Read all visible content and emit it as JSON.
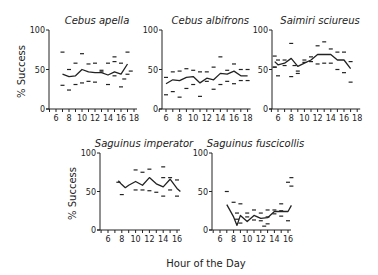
{
  "figure": {
    "x_label": "Hour of the Day",
    "y_label": "% Success",
    "colors": {
      "ink": "#222222",
      "background": "#ffffff"
    }
  },
  "chart_data": [
    {
      "type": "line",
      "title": "Cebus apella",
      "xlabel": "Hour of the Day",
      "ylabel": "% Success",
      "xlim": [
        5,
        18
      ],
      "ylim": [
        0,
        100
      ],
      "x_ticks": [
        6,
        8,
        10,
        12,
        14,
        16,
        18
      ],
      "y_ticks": [
        0,
        50,
        100
      ],
      "show_ylabel": true,
      "layout": {
        "ox": 49,
        "oy": 109,
        "ytop": 30,
        "x6": 56,
        "pxPerHour": 6.5
      },
      "x": [
        7,
        8,
        9,
        10,
        11,
        12,
        13,
        14,
        15,
        16,
        17
      ],
      "series": [
        {
          "name": "mean",
          "values": [
            44,
            41,
            42,
            50,
            47,
            46,
            46,
            43,
            47,
            44,
            57
          ]
        },
        {
          "name": "upper",
          "values": [
            72,
            50,
            58,
            70,
            57,
            58,
            49,
            58,
            60,
            58,
            72
          ]
        },
        {
          "name": "lower",
          "values": [
            30,
            24,
            31,
            33,
            35,
            34,
            47,
            31,
            42,
            28,
            44
          ]
        }
      ],
      "extra_marks": [
        {
          "x": 17.5,
          "y": 48
        },
        {
          "x": 16.5,
          "y": 38
        },
        {
          "x": 15,
          "y": 66
        }
      ]
    },
    {
      "type": "line",
      "title": "Cebus albifrons",
      "xlabel": "Hour of the Day",
      "ylabel": "",
      "xlim": [
        5,
        18
      ],
      "ylim": [
        0,
        100
      ],
      "x_ticks": [
        6,
        8,
        10,
        12,
        14,
        16,
        18
      ],
      "y_ticks": [
        0,
        50,
        100
      ],
      "show_ylabel": false,
      "layout": {
        "ox": 162,
        "oy": 109,
        "ytop": 30,
        "x6": 166,
        "pxPerHour": 6.8
      },
      "x": [
        6,
        7,
        8,
        9,
        10,
        11,
        12,
        13,
        14,
        15,
        16,
        17,
        18
      ],
      "series": [
        {
          "name": "mean",
          "values": [
            32,
            37,
            36,
            40,
            41,
            33,
            39,
            37,
            45,
            44,
            48,
            42,
            42
          ]
        },
        {
          "name": "upper",
          "values": [
            40,
            47,
            48,
            51,
            49,
            47,
            47,
            53,
            66,
            49,
            57,
            50,
            50
          ]
        },
        {
          "name": "lower",
          "values": [
            18,
            22,
            15,
            26,
            31,
            16,
            35,
            25,
            31,
            35,
            32,
            36,
            36
          ]
        }
      ],
      "extra_marks": []
    },
    {
      "type": "line",
      "title": "Saimiri sciureus",
      "xlabel": "Hour of the Day",
      "ylabel": "",
      "xlim": [
        5,
        18
      ],
      "ylim": [
        0,
        100
      ],
      "x_ticks": [
        6,
        8,
        10,
        12,
        14,
        16,
        18
      ],
      "y_ticks": [
        0,
        50,
        100
      ],
      "show_ylabel": false,
      "layout": {
        "ox": 272,
        "oy": 109,
        "ytop": 30,
        "x6": 278,
        "pxPerHour": 6.6
      },
      "x": [
        5.5,
        6,
        7,
        8,
        9,
        10,
        11,
        12,
        13,
        14,
        15,
        16,
        17
      ],
      "series": [
        {
          "name": "mean",
          "values": [
            60,
            56,
            58,
            64,
            54,
            58,
            62,
            69,
            69,
            69,
            62,
            62,
            51
          ]
        },
        {
          "name": "upper",
          "values": [
            67,
            62,
            62,
            83,
            45,
            62,
            66,
            80,
            85,
            76,
            72,
            72,
            60
          ]
        },
        {
          "name": "lower",
          "values": [
            53,
            42,
            55,
            41,
            48,
            59,
            60,
            57,
            58,
            58,
            50,
            46,
            34
          ]
        }
      ],
      "extra_marks": [
        {
          "x": 5.5,
          "y": 53
        },
        {
          "x": 8.5,
          "y": 55
        }
      ]
    },
    {
      "type": "line",
      "title": "Saguinus imperator",
      "xlabel": "Hour of the Day",
      "ylabel": "% Success",
      "xlim": [
        5,
        17
      ],
      "ylim": [
        0,
        100
      ],
      "x_ticks": [
        6,
        8,
        10,
        12,
        14,
        16
      ],
      "y_ticks": [
        0,
        50,
        100
      ],
      "show_ylabel": true,
      "layout": {
        "ox": 100,
        "oy": 230,
        "ytop": 153,
        "x6": 108,
        "pxPerHour": 6.9
      },
      "x": [
        7.5,
        8,
        8.5,
        9,
        10,
        11,
        12,
        13,
        14,
        15,
        16,
        16.5
      ],
      "series": [
        {
          "name": "mean",
          "values": [
            64,
            59,
            55,
            58,
            63,
            58,
            68,
            60,
            56,
            66,
            54,
            50
          ]
        },
        {
          "name": "upper",
          "values": [
            62,
            null,
            null,
            null,
            78,
            75,
            79,
            null,
            82,
            68,
            65,
            null
          ]
        },
        {
          "name": "lower",
          "values": [
            null,
            46,
            null,
            null,
            52,
            52,
            51,
            49,
            44,
            52,
            44,
            null
          ]
        }
      ],
      "extra_marks": [
        {
          "x": 14,
          "y": 68
        }
      ]
    },
    {
      "type": "line",
      "title": "Saguinus fuscicollis",
      "xlabel": "Hour of the Day",
      "ylabel": "",
      "xlim": [
        5,
        17
      ],
      "ylim": [
        0,
        100
      ],
      "x_ticks": [
        6,
        8,
        10,
        12,
        14,
        16
      ],
      "y_ticks": [
        0,
        50,
        100
      ],
      "show_ylabel": false,
      "layout": {
        "ox": 212,
        "oy": 230,
        "ytop": 153,
        "x6": 220,
        "pxPerHour": 6.8
      },
      "x": [
        7,
        8,
        8.5,
        9,
        10,
        11,
        12,
        13,
        14,
        15,
        16,
        16.5
      ],
      "series": [
        {
          "name": "mean",
          "values": [
            33,
            17,
            6,
            19,
            11,
            19,
            15,
            16,
            24,
            24,
            24,
            32
          ]
        },
        {
          "name": "upper",
          "values": [
            50,
            36,
            22,
            34,
            22,
            26,
            22,
            26,
            26,
            34,
            62,
            68
          ]
        },
        {
          "name": "lower",
          "values": [
            null,
            null,
            14,
            9,
            17,
            13,
            12,
            8,
            21,
            18,
            12,
            57
          ]
        }
      ],
      "extra_marks": [
        {
          "x": 13,
          "y": 17
        },
        {
          "x": 12.5,
          "y": 5
        },
        {
          "x": 15,
          "y": 25
        }
      ]
    }
  ]
}
